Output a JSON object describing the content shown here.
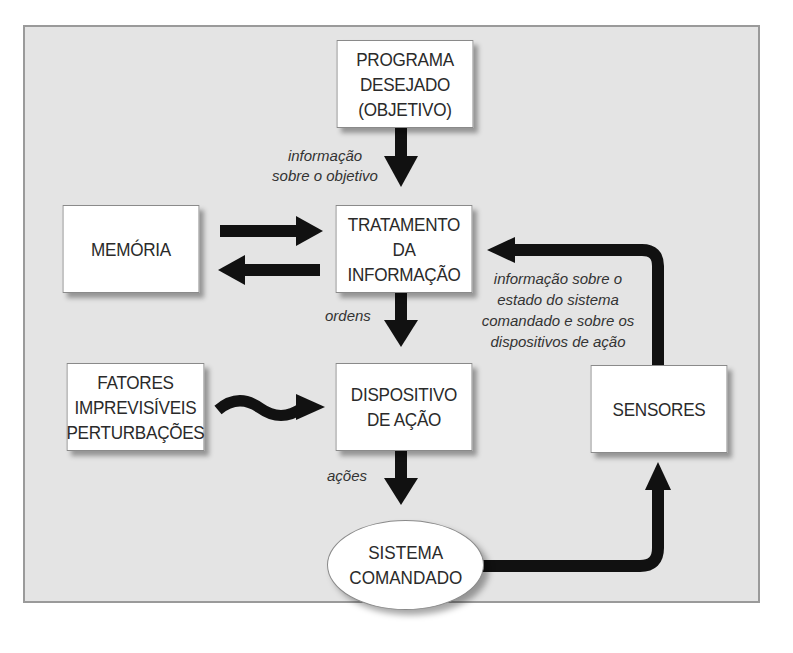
{
  "diagram": {
    "colors": {
      "background": "#e4e4e4",
      "border": "#9a9a9a",
      "box_fill": "#ffffff",
      "arrow": "#111111",
      "text": "#2a2a2a"
    },
    "nodes": {
      "programa": {
        "lines": [
          "PROGRAMA",
          "DESEJADO",
          "(OBJETIVO)"
        ]
      },
      "tratamento": {
        "lines": [
          "TRATAMENTO",
          "DA",
          "INFORMAÇÃO"
        ]
      },
      "memoria": {
        "lines": [
          "MEMÓRIA"
        ]
      },
      "fatores": {
        "lines": [
          "FATORES",
          "IMPREVISÍVEIS",
          "PERTURBAÇÕES"
        ]
      },
      "dispositivo": {
        "lines": [
          "DISPOSITIVO",
          "DE AÇÃO"
        ]
      },
      "sensores": {
        "lines": [
          "SENSORES"
        ]
      },
      "sistema": {
        "lines": [
          "SISTEMA",
          "COMANDADO"
        ]
      }
    },
    "edge_labels": {
      "objetivo": {
        "lines": [
          "informação",
          "sobre o objetivo"
        ]
      },
      "ordens": {
        "lines": [
          "ordens"
        ]
      },
      "acoes": {
        "lines": [
          "ações"
        ]
      },
      "feedback": {
        "lines": [
          "informação sobre o",
          "estado do sistema",
          "comandado e sobre os",
          "dispositivos de ação"
        ]
      }
    },
    "edges": [
      {
        "from": "PROGRAMA DESEJADO (OBJETIVO)",
        "to": "TRATAMENTO DA INFORMAÇÃO",
        "label": "informação sobre o objetivo"
      },
      {
        "from": "MEMÓRIA",
        "to": "TRATAMENTO DA INFORMAÇÃO",
        "label": ""
      },
      {
        "from": "TRATAMENTO DA INFORMAÇÃO",
        "to": "MEMÓRIA",
        "label": ""
      },
      {
        "from": "TRATAMENTO DA INFORMAÇÃO",
        "to": "DISPOSITIVO DE AÇÃO",
        "label": "ordens"
      },
      {
        "from": "FATORES IMPREVISÍVEIS PERTURBAÇÕES",
        "to": "DISPOSITIVO DE AÇÃO",
        "label": "",
        "style": "wavy"
      },
      {
        "from": "DISPOSITIVO DE AÇÃO",
        "to": "SISTEMA COMANDADO",
        "label": "ações"
      },
      {
        "from": "SISTEMA COMANDADO",
        "to": "SENSORES",
        "label": ""
      },
      {
        "from": "SENSORES",
        "to": "TRATAMENTO DA INFORMAÇÃO",
        "label": "informação sobre o estado do sistema comandado e sobre os dispositivos de ação"
      }
    ]
  }
}
